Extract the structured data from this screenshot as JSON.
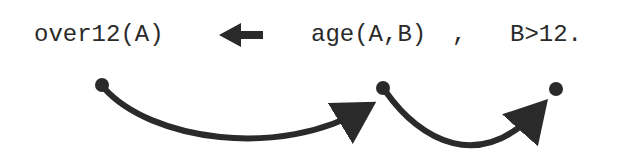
{
  "rule": {
    "head": "over12(A)",
    "body": [
      {
        "text": "age(A,B)"
      },
      {
        "text": ","
      },
      {
        "text": "B>12."
      }
    ],
    "implication_icon": "left-arrow-icon"
  },
  "flow": {
    "nodes": [
      {
        "id": "head-node",
        "x": 102,
        "y": 85
      },
      {
        "id": "age-node",
        "x": 383,
        "y": 88
      },
      {
        "id": "compare-node",
        "x": 556,
        "y": 89
      }
    ],
    "edges": [
      {
        "from": "head-node",
        "to": "age-node"
      },
      {
        "from": "age-node",
        "to": "compare-node"
      }
    ]
  },
  "colors": {
    "ink": "#2a2a2a",
    "background": "#ffffff"
  }
}
